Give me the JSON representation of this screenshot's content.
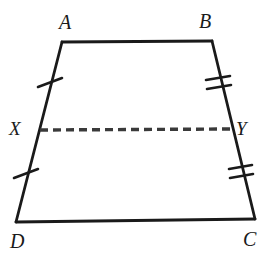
{
  "figure": {
    "name": "trapezoid-midsegment",
    "shape_type": "trapezoid",
    "background_color": "#ffffff",
    "stroke_color": "#1a1a1a",
    "stroke_width": 2.6,
    "labels": {
      "A": "A",
      "B": "B",
      "C": "C",
      "D": "D",
      "X": "X",
      "Y": "Y"
    },
    "vertices": {
      "A": {
        "x": 62,
        "y": 42
      },
      "B": {
        "x": 212,
        "y": 41
      },
      "C": {
        "x": 255,
        "y": 219
      },
      "D": {
        "x": 16,
        "y": 222
      }
    },
    "midsegment_points": {
      "X": {
        "x": 40,
        "y": 130
      },
      "Y": {
        "x": 230,
        "y": 129
      }
    },
    "edges": [
      {
        "name": "AB",
        "from": "A",
        "to": "B",
        "style": "solid",
        "ticks": 0
      },
      {
        "name": "BC",
        "from": "B",
        "to": "C",
        "style": "solid",
        "ticks": 2
      },
      {
        "name": "CD",
        "from": "C",
        "to": "D",
        "style": "solid",
        "ticks": 0
      },
      {
        "name": "DA",
        "from": "D",
        "to": "A",
        "style": "solid",
        "ticks": 1
      }
    ],
    "segments": [
      {
        "name": "XY",
        "from": "X",
        "to": "Y",
        "style": "dashed",
        "ticks": 0
      }
    ],
    "tick_marks": [
      {
        "name": "tick-AX",
        "segment": "AX",
        "count": 1,
        "x": 50,
        "y": 82
      },
      {
        "name": "tick-XD",
        "segment": "XD",
        "count": 1,
        "x": 26,
        "y": 173
      },
      {
        "name": "tick-BY",
        "segment": "BY",
        "count": 2,
        "x": 217,
        "y": 82
      },
      {
        "name": "tick-YC",
        "segment": "YC",
        "count": 2,
        "x": 240,
        "y": 172
      }
    ],
    "dash_pattern": "7 4"
  }
}
